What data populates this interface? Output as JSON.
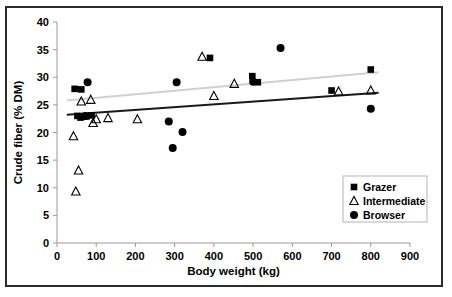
{
  "chart_data": {
    "type": "scatter",
    "title": "",
    "xlabel": "Body weight (kg)",
    "ylabel": "Crude fiber (% DM)",
    "xlim": [
      0,
      900
    ],
    "ylim": [
      0,
      40
    ],
    "xticks": [
      0,
      100,
      200,
      300,
      400,
      500,
      600,
      700,
      800,
      900
    ],
    "yticks": [
      0,
      5,
      10,
      15,
      20,
      25,
      30,
      35,
      40
    ],
    "grid": false,
    "legend_position": "lower-right-inside",
    "series": [
      {
        "name": "Grazer",
        "marker": "filled-square",
        "color": "#000000",
        "points": [
          [
            45,
            27.9
          ],
          [
            62,
            27.8
          ],
          [
            52,
            23.0
          ],
          [
            60,
            22.7
          ],
          [
            75,
            22.9
          ],
          [
            88,
            23.1
          ],
          [
            390,
            33.5
          ],
          [
            498,
            30.2
          ],
          [
            512,
            29.1
          ],
          [
            700,
            27.6
          ],
          [
            800,
            31.4
          ]
        ]
      },
      {
        "name": "Intermediate",
        "marker": "open-triangle",
        "color": "#000000",
        "points": [
          [
            42,
            19.3
          ],
          [
            48,
            9.3
          ],
          [
            55,
            13.1
          ],
          [
            62,
            25.6
          ],
          [
            86,
            25.9
          ],
          [
            92,
            21.7
          ],
          [
            100,
            22.4
          ],
          [
            130,
            22.6
          ],
          [
            205,
            22.4
          ],
          [
            370,
            33.7
          ],
          [
            400,
            26.6
          ],
          [
            452,
            28.8
          ],
          [
            718,
            27.4
          ],
          [
            800,
            27.6
          ]
        ]
      },
      {
        "name": "Browser",
        "marker": "filled-circle",
        "color": "#000000",
        "points": [
          [
            78,
            29.1
          ],
          [
            72,
            23.0
          ],
          [
            285,
            22.0
          ],
          [
            295,
            17.2
          ],
          [
            305,
            29.1
          ],
          [
            320,
            20.1
          ],
          [
            500,
            29.2
          ],
          [
            570,
            35.3
          ],
          [
            800,
            24.3
          ]
        ]
      }
    ],
    "trendlines": [
      {
        "name": "upper-trend",
        "color": "#d0d0d0",
        "x0": 25,
        "y0": 25.8,
        "x1": 820,
        "y1": 30.9
      },
      {
        "name": "lower-trend",
        "color": "#1a1a1a",
        "x0": 25,
        "y0": 23.2,
        "x1": 820,
        "y1": 27.2
      }
    ],
    "legend": [
      {
        "label": "Grazer",
        "marker": "filled-square"
      },
      {
        "label": "Intermediate",
        "marker": "open-triangle"
      },
      {
        "label": "Browser",
        "marker": "filled-circle"
      }
    ]
  }
}
